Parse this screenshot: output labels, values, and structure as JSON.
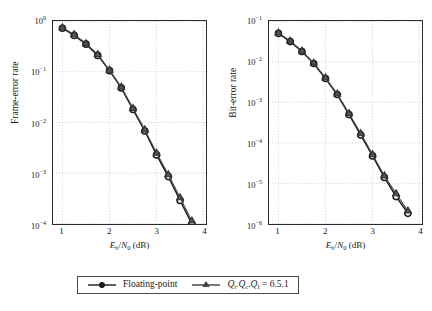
{
  "figure": {
    "background": "#ffffff",
    "axis_color": "#2b2b2b",
    "grid_color": "#b9b9b9"
  },
  "legend": {
    "entries": [
      {
        "label": "Floating-point",
        "marker": "circle-marker",
        "color": "#1a1a1a"
      },
      {
        "label": "Qi.Qc.Qf = 6.5.1",
        "marker": "triangle-marker",
        "color": "#3d3d3d"
      }
    ]
  },
  "chart_data": [
    {
      "type": "line",
      "id": "frame-error-rate",
      "title": "",
      "xlabel": "Eb/N0 (dB)",
      "ylabel": "Frame-error rate",
      "xscale": "linear",
      "yscale": "log",
      "xlim": [
        0.75,
        4.0
      ],
      "ylim": [
        0.0001,
        1.0
      ],
      "xticks": [
        1,
        2,
        3,
        4
      ],
      "xticklabels": [
        "1",
        "2",
        "3",
        "4"
      ],
      "yticks": [
        1,
        0.1,
        0.01,
        0.001,
        0.0001
      ],
      "yticklabels": [
        "10^0",
        "10^-1",
        "10^-2",
        "10^-3",
        "10^-4"
      ],
      "grid": true,
      "grid_style": "dotted",
      "x": [
        0.95,
        1.2,
        1.45,
        1.7,
        1.95,
        2.2,
        2.45,
        2.7,
        2.95,
        3.2,
        3.45,
        3.7
      ],
      "series": [
        {
          "name": "Floating-point",
          "marker": "circle-marker",
          "values": [
            0.72,
            0.52,
            0.35,
            0.21,
            0.105,
            0.048,
            0.018,
            0.0068,
            0.0023,
            0.00086,
            0.00029,
            0.0001
          ]
        },
        {
          "name": "Qi.Qc.Qf = 6.5.1",
          "marker": "triangle-marker",
          "values": [
            0.74,
            0.54,
            0.36,
            0.22,
            0.108,
            0.05,
            0.019,
            0.0072,
            0.0025,
            0.00094,
            0.00033,
            0.000115
          ]
        }
      ]
    },
    {
      "type": "line",
      "id": "bit-error-rate",
      "title": "",
      "xlabel": "Eb/N0 (dB)",
      "ylabel": "Bit-error rate",
      "xscale": "linear",
      "yscale": "log",
      "xlim": [
        0.75,
        4.0
      ],
      "ylim": [
        1e-06,
        0.2
      ],
      "xticks": [
        1,
        2,
        3,
        4
      ],
      "xticklabels": [
        "1",
        "2",
        "3",
        "4"
      ],
      "yticks": [
        0.1,
        0.01,
        0.001,
        0.0001,
        1e-05,
        1e-06
      ],
      "yticklabels": [
        "10^-1",
        "10^-2",
        "10^-3",
        "10^-4",
        "10^-5",
        "10^-6"
      ],
      "grid": true,
      "grid_style": "dotted",
      "x": [
        0.95,
        1.2,
        1.45,
        1.7,
        1.95,
        2.2,
        2.45,
        2.7,
        2.95,
        3.2,
        3.45,
        3.7
      ],
      "series": [
        {
          "name": "Floating-point",
          "marker": "circle-marker",
          "values": [
            0.095,
            0.058,
            0.032,
            0.0155,
            0.0063,
            0.0024,
            0.00072,
            0.00021,
            6e-05,
            1.65e-05,
            5.2e-06,
            1.9e-06
          ]
        },
        {
          "name": "Qi.Qc.Qf = 6.5.1",
          "marker": "triangle-marker",
          "values": [
            0.098,
            0.06,
            0.033,
            0.016,
            0.0066,
            0.0025,
            0.00077,
            0.00023,
            6.5e-05,
            1.82e-05,
            6.2e-06,
            2.2e-06
          ]
        }
      ]
    }
  ],
  "panels": {
    "left": {
      "ylabel": "Frame-error rate",
      "yticklabels": [
        {
          "mantissa": "10",
          "exp": "0"
        },
        {
          "mantissa": "10",
          "exp": "−1"
        },
        {
          "mantissa": "10",
          "exp": "−2"
        },
        {
          "mantissa": "10",
          "exp": "−3"
        },
        {
          "mantissa": "10",
          "exp": "−4"
        }
      ],
      "xticklabels": [
        "1",
        "2",
        "3",
        "4"
      ]
    },
    "right": {
      "ylabel": "Bit-error rate",
      "yticklabels": [
        {
          "mantissa": "10",
          "exp": "−1"
        },
        {
          "mantissa": "10",
          "exp": "−2"
        },
        {
          "mantissa": "10",
          "exp": "−3"
        },
        {
          "mantissa": "10",
          "exp": "−4"
        },
        {
          "mantissa": "10",
          "exp": "−5"
        },
        {
          "mantissa": "10",
          "exp": "−6"
        }
      ],
      "xticklabels": [
        "1",
        "2",
        "3",
        "4"
      ]
    }
  },
  "axis_title_parts": {
    "e": "E",
    "b": "b",
    "slash": "/",
    "n": "N",
    "zero": "0",
    "unit": "(dB)"
  },
  "legend_math": {
    "q": "Q",
    "sub_i": "i",
    "sub_c": "c",
    "sub_f": "f",
    "dot": ".",
    "equals": "=",
    "value": "6.5.1",
    "floating": "Floating-point"
  }
}
